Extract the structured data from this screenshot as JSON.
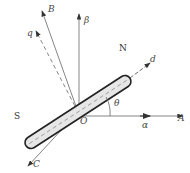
{
  "diagram": {
    "type": "vector-diagram",
    "origin": {
      "label": "O",
      "x": 78,
      "y": 112
    },
    "magnet": {
      "north_label": "N",
      "south_label": "S",
      "fill": "#e6e6e6",
      "stroke": "#222222"
    },
    "axes": [
      {
        "id": "A",
        "label": "A",
        "italic": true,
        "end": [
          183,
          116
        ]
      },
      {
        "id": "alpha",
        "label": "α",
        "italic": true,
        "end": [
          148,
          116
        ]
      },
      {
        "id": "beta",
        "label": "β",
        "italic": true,
        "end": [
          79,
          14
        ]
      },
      {
        "id": "B",
        "label": "B",
        "italic": true,
        "end": [
          42,
          12
        ]
      },
      {
        "id": "q",
        "label": "q",
        "italic": true,
        "dashed": true,
        "end": [
          36,
          32
        ]
      },
      {
        "id": "C",
        "label": "C",
        "italic": true,
        "end": [
          28,
          166
        ]
      },
      {
        "id": "d",
        "label": "d",
        "italic": true,
        "dashed": true,
        "end": [
          148,
          50
        ]
      }
    ],
    "angle": {
      "label": "θ"
    },
    "colors": {
      "line": "#555555",
      "dark_line": "#222222",
      "text": "#444444"
    }
  }
}
